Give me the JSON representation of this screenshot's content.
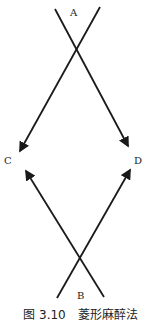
{
  "figure": {
    "caption": "图 3.10　菱形麻醉法",
    "labels": {
      "A": "A",
      "B": "B",
      "C": "C",
      "D": "D"
    },
    "arrows": [
      {
        "from": "A (left start)",
        "to": "D",
        "x1": 55,
        "y1": 9,
        "x2": 128,
        "y2": 146
      },
      {
        "from": "A (right start)",
        "to": "C",
        "x1": 100,
        "y1": 7,
        "x2": 20,
        "y2": 151
      },
      {
        "from": "B (left start)",
        "to": "D",
        "x1": 57,
        "y1": 298,
        "x2": 130,
        "y2": 170
      },
      {
        "from": "B (right start)",
        "to": "C",
        "x1": 104,
        "y1": 297,
        "x2": 26,
        "y2": 171
      }
    ],
    "line_color": "#1a1a1a"
  }
}
